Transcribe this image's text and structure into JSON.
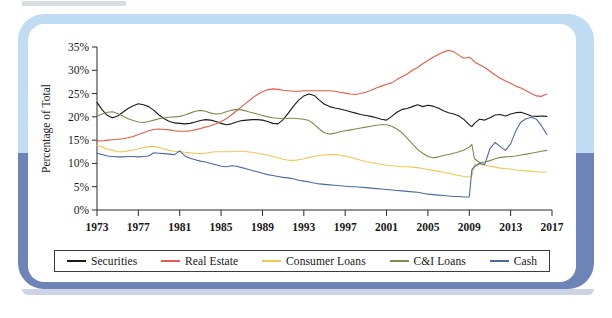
{
  "frame": {
    "band_light_color": "#bfdcf2",
    "band_dark_color": "#6e83b8",
    "card_color": "#ffffff"
  },
  "chart_data": {
    "type": "line",
    "title": "",
    "xlabel": "",
    "ylabel": "Percentage of Total",
    "xlim": [
      1973,
      2017
    ],
    "ylim": [
      0,
      35
    ],
    "ytick_labels": [
      "0%",
      "5%",
      "10%",
      "15%",
      "20%",
      "25%",
      "30%",
      "35%"
    ],
    "ytick_values": [
      0,
      5,
      10,
      15,
      20,
      25,
      30,
      35
    ],
    "xtick_labels": [
      "1973",
      "1977",
      "1981",
      "1985",
      "1989",
      "1993",
      "1997",
      "2001",
      "2005",
      "2009",
      "2013",
      "2017"
    ],
    "xtick_values": [
      1973,
      1977,
      1981,
      1985,
      1989,
      1993,
      1997,
      2001,
      2005,
      2009,
      2013,
      2017
    ],
    "grid": false,
    "legend_position": "bottom",
    "x": [
      1973,
      1973.5,
      1974,
      1974.5,
      1975,
      1975.5,
      1976,
      1976.5,
      1977,
      1977.5,
      1978,
      1978.5,
      1979,
      1979.5,
      1980,
      1980.5,
      1981,
      1981.5,
      1982,
      1982.5,
      1983,
      1983.5,
      1984,
      1984.5,
      1985,
      1985.5,
      1986,
      1986.5,
      1987,
      1987.5,
      1988,
      1988.5,
      1989,
      1989.5,
      1990,
      1990.5,
      1991,
      1991.5,
      1992,
      1992.5,
      1993,
      1993.5,
      1994,
      1994.5,
      1995,
      1995.5,
      1996,
      1996.5,
      1997,
      1997.5,
      1998,
      1998.5,
      1999,
      1999.5,
      2000,
      2000.5,
      2001,
      2001.5,
      2002,
      2002.5,
      2003,
      2003.5,
      2004,
      2004.5,
      2005,
      2005.5,
      2006,
      2006.5,
      2007,
      2007.5,
      2008,
      2008.5,
      2009,
      2009.25,
      2009.5,
      2010,
      2010.5,
      2011,
      2011.5,
      2012,
      2012.5,
      2013,
      2013.5,
      2014,
      2014.5,
      2015,
      2015.5,
      2016,
      2016.5
    ],
    "series": [
      {
        "name": "Securities",
        "color": "#1a1a1a",
        "values": [
          23.1,
          21.5,
          20.3,
          19.8,
          20.2,
          21.0,
          21.8,
          22.4,
          22.8,
          22.6,
          22.2,
          21.4,
          20.4,
          19.6,
          19.0,
          18.7,
          18.6,
          18.5,
          18.6,
          18.9,
          19.2,
          19.4,
          19.3,
          19.0,
          18.6,
          18.3,
          18.5,
          18.9,
          19.2,
          19.3,
          19.4,
          19.4,
          19.3,
          19.0,
          18.6,
          18.5,
          19.4,
          20.8,
          22.3,
          23.6,
          24.5,
          24.9,
          24.6,
          23.6,
          22.7,
          22.2,
          21.9,
          21.7,
          21.4,
          21.1,
          20.8,
          20.5,
          20.3,
          20.1,
          19.8,
          19.5,
          19.3,
          20.1,
          21.0,
          21.6,
          21.8,
          22.2,
          22.6,
          22.2,
          22.5,
          22.3,
          21.9,
          21.3,
          20.9,
          20.6,
          20.2,
          19.4,
          18.3,
          17.9,
          18.6,
          19.5,
          19.3,
          19.8,
          20.4,
          20.5,
          20.2,
          20.6,
          20.9,
          21.0,
          20.6,
          20.2,
          20.1,
          20.2,
          20.1
        ]
      },
      {
        "name": "Real Estate",
        "color": "#e8594a",
        "values": [
          14.9,
          14.8,
          15.0,
          15.1,
          15.2,
          15.3,
          15.5,
          15.8,
          16.2,
          16.6,
          17.0,
          17.3,
          17.4,
          17.3,
          17.2,
          17.0,
          16.9,
          16.9,
          17.0,
          17.2,
          17.5,
          17.8,
          18.1,
          18.5,
          19.0,
          19.6,
          20.4,
          21.3,
          22.2,
          23.1,
          24.0,
          24.8,
          25.4,
          25.8,
          26.0,
          25.9,
          25.7,
          25.6,
          25.5,
          25.5,
          25.6,
          25.6,
          25.6,
          25.6,
          25.6,
          25.6,
          25.5,
          25.3,
          25.1,
          24.9,
          24.8,
          25.0,
          25.3,
          25.7,
          26.2,
          26.6,
          27.0,
          27.3,
          28.0,
          28.6,
          29.2,
          30.0,
          30.6,
          31.4,
          32.1,
          32.8,
          33.4,
          33.9,
          34.3,
          34.0,
          33.2,
          32.6,
          32.8,
          32.4,
          31.8,
          31.2,
          30.6,
          29.8,
          29.0,
          28.3,
          27.7,
          27.2,
          26.6,
          26.2,
          25.6,
          25.0,
          24.5,
          24.4,
          24.9
        ]
      },
      {
        "name": "Consumer Loans",
        "color": "#f0c858",
        "values": [
          13.9,
          13.5,
          13.1,
          12.8,
          12.5,
          12.5,
          12.7,
          12.9,
          13.1,
          13.4,
          13.6,
          13.6,
          13.4,
          13.1,
          12.8,
          12.6,
          12.5,
          12.4,
          12.3,
          12.2,
          12.1,
          12.2,
          12.4,
          12.5,
          12.5,
          12.5,
          12.5,
          12.6,
          12.6,
          12.5,
          12.4,
          12.2,
          12.0,
          11.8,
          11.5,
          11.2,
          10.9,
          10.7,
          10.6,
          10.8,
          11.0,
          11.3,
          11.5,
          11.7,
          11.8,
          11.9,
          11.9,
          11.8,
          11.6,
          11.3,
          11.0,
          10.7,
          10.4,
          10.2,
          10.0,
          9.8,
          9.6,
          9.5,
          9.4,
          9.3,
          9.3,
          9.2,
          9.1,
          8.9,
          8.7,
          8.5,
          8.3,
          8.1,
          7.9,
          7.6,
          7.4,
          7.2,
          7.1,
          7.2,
          9.8,
          9.8,
          9.6,
          9.4,
          9.2,
          9.0,
          8.9,
          8.8,
          8.6,
          8.5,
          8.4,
          8.3,
          8.2,
          8.1,
          8.2
        ]
      },
      {
        "name": "C&I Loans",
        "color": "#7d8c4e",
        "values": [
          20.2,
          20.6,
          21.0,
          21.1,
          20.7,
          20.2,
          19.6,
          19.2,
          18.9,
          18.8,
          19.0,
          19.3,
          19.6,
          19.8,
          19.9,
          20.0,
          20.1,
          20.4,
          20.8,
          21.2,
          21.4,
          21.2,
          20.8,
          20.6,
          20.7,
          21.1,
          21.4,
          21.6,
          21.5,
          21.2,
          20.9,
          20.6,
          20.3,
          20.0,
          19.8,
          19.7,
          19.6,
          19.7,
          19.7,
          19.6,
          19.5,
          19.2,
          18.4,
          17.4,
          16.6,
          16.3,
          16.5,
          16.8,
          17.0,
          17.2,
          17.4,
          17.6,
          17.8,
          18.0,
          18.2,
          18.3,
          18.3,
          18.0,
          17.4,
          16.6,
          15.4,
          14.2,
          13.0,
          12.2,
          11.5,
          11.2,
          11.4,
          11.7,
          11.9,
          12.2,
          12.5,
          12.9,
          13.5,
          14.1,
          11.0,
          10.2,
          10.3,
          10.6,
          11.0,
          11.3,
          11.4,
          11.5,
          11.6,
          11.8,
          12.0,
          12.2,
          12.4,
          12.6,
          12.8
        ]
      },
      {
        "name": "Cash",
        "color": "#4a6aa5",
        "values": [
          12.2,
          11.9,
          11.6,
          11.5,
          11.4,
          11.4,
          11.5,
          11.5,
          11.4,
          11.5,
          11.6,
          12.3,
          12.2,
          12.1,
          12.0,
          11.9,
          12.7,
          11.6,
          11.1,
          10.8,
          10.5,
          10.3,
          10.0,
          9.7,
          9.4,
          9.3,
          9.5,
          9.4,
          9.1,
          8.8,
          8.5,
          8.2,
          7.9,
          7.6,
          7.4,
          7.2,
          7.0,
          6.9,
          6.7,
          6.4,
          6.2,
          6.0,
          5.8,
          5.6,
          5.5,
          5.4,
          5.3,
          5.2,
          5.1,
          5.0,
          5.0,
          4.9,
          4.8,
          4.7,
          4.6,
          4.5,
          4.4,
          4.3,
          4.2,
          4.1,
          4.0,
          3.9,
          3.8,
          3.6,
          3.4,
          3.3,
          3.2,
          3.1,
          3.0,
          2.9,
          2.9,
          2.8,
          2.8,
          8.6,
          9.3,
          10.0,
          9.8,
          13.2,
          14.5,
          13.6,
          12.8,
          14.2,
          17.0,
          18.9,
          19.6,
          19.9,
          19.5,
          18.0,
          16.2
        ]
      }
    ]
  },
  "legend": {
    "items": [
      {
        "label": "Securities",
        "color": "#1a1a1a"
      },
      {
        "label": "Real Estate",
        "color": "#e8594a"
      },
      {
        "label": "Consumer Loans",
        "color": "#f0c858"
      },
      {
        "label": "C&I Loans",
        "color": "#7d8c4e"
      },
      {
        "label": "Cash",
        "color": "#4a6aa5"
      }
    ]
  }
}
